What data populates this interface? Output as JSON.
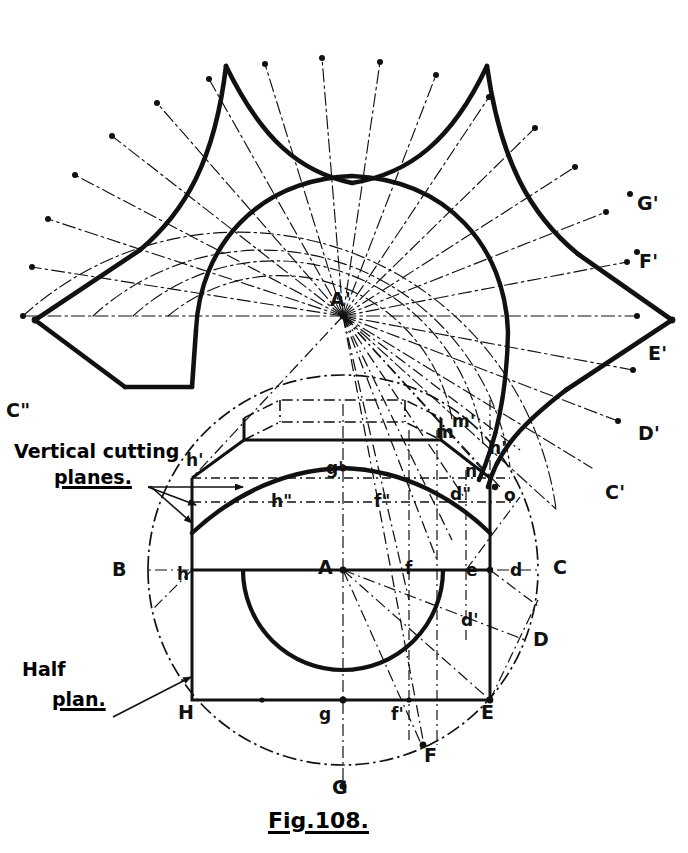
{
  "figure": {
    "caption": "Fig.108."
  },
  "annotations": {
    "vertical_cutting_planes_line1": "Vertical cutting",
    "vertical_cutting_planes_line2": "planes.",
    "half_plan_line1": "Half",
    "half_plan_line2": "plan."
  },
  "development_labels": [
    {
      "id": "apex",
      "text": "A'",
      "x": 335,
      "y": 300
    },
    {
      "id": "g-dev",
      "text": "G'",
      "x": 637,
      "y": 194
    },
    {
      "id": "f-dev",
      "text": "F'",
      "x": 639,
      "y": 252
    },
    {
      "id": "e-dev",
      "text": "E'",
      "x": 648,
      "y": 344
    },
    {
      "id": "d-dev",
      "text": "D'",
      "x": 638,
      "y": 424
    },
    {
      "id": "c-dev",
      "text": "C'",
      "x": 605,
      "y": 483
    },
    {
      "id": "c-dev2",
      "text": "C\"",
      "x": 6,
      "y": 401
    }
  ],
  "elevation_labels": [
    {
      "id": "m-prime",
      "text": "m'",
      "x": 452,
      "y": 413
    },
    {
      "id": "m",
      "text": "m",
      "x": 438,
      "y": 425
    },
    {
      "id": "n-prime",
      "text": "n'",
      "x": 489,
      "y": 440
    },
    {
      "id": "n",
      "text": "n",
      "x": 465,
      "y": 463
    },
    {
      "id": "o",
      "text": "o",
      "x": 504,
      "y": 487
    },
    {
      "id": "d-dbl",
      "text": "d\"",
      "x": 452,
      "y": 486
    },
    {
      "id": "h-prime",
      "text": "h'",
      "x": 186,
      "y": 452
    },
    {
      "id": "g-prime",
      "text": "g'",
      "x": 326,
      "y": 460
    },
    {
      "id": "h-dbl",
      "text": "h\"",
      "x": 273,
      "y": 493
    },
    {
      "id": "f-dbl",
      "text": "f\"",
      "x": 375,
      "y": 493
    }
  ],
  "plan_labels": [
    {
      "id": "B",
      "text": "B",
      "x": 112,
      "y": 560
    },
    {
      "id": "h",
      "text": "h",
      "x": 177,
      "y": 564
    },
    {
      "id": "A",
      "text": "A",
      "x": 320,
      "y": 558
    },
    {
      "id": "f",
      "text": "f",
      "x": 405,
      "y": 560
    },
    {
      "id": "e",
      "text": "e",
      "x": 466,
      "y": 561
    },
    {
      "id": "d",
      "text": "d",
      "x": 510,
      "y": 561
    },
    {
      "id": "C",
      "text": "C",
      "x": 553,
      "y": 558
    },
    {
      "id": "d2",
      "text": "d'",
      "x": 462,
      "y": 614
    },
    {
      "id": "D",
      "text": "D",
      "x": 533,
      "y": 630
    },
    {
      "id": "H",
      "text": "H",
      "x": 178,
      "y": 703
    },
    {
      "id": "g",
      "text": "g",
      "x": 320,
      "y": 704
    },
    {
      "id": "f2",
      "text": "f'",
      "x": 392,
      "y": 705
    },
    {
      "id": "E",
      "text": "E",
      "x": 481,
      "y": 703
    },
    {
      "id": "F",
      "text": "F",
      "x": 424,
      "y": 746
    },
    {
      "id": "G",
      "text": "G",
      "x": 332,
      "y": 778
    }
  ],
  "colors": {
    "ink": "#111111",
    "paper": "#ffffff",
    "construction": "#1a1a1a"
  },
  "geometry": {
    "apex": {
      "x": 343,
      "y": 316
    },
    "ray_count": 21,
    "outer_radius": 320,
    "mid_radius": 250,
    "inner_radius": 175,
    "plan_center": {
      "x": 343,
      "y": 570
    },
    "plan_radius": 195,
    "base_rect": {
      "left": 183,
      "right": 490,
      "top": 570,
      "bottom": 700
    }
  }
}
